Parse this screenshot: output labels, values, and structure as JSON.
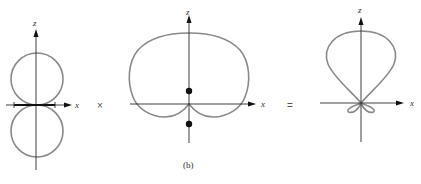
{
  "figure": {
    "caption": "(b)",
    "operators": {
      "times": "×",
      "equals": "="
    },
    "panels": [
      {
        "id": "element-pattern",
        "description": "Figure-eight dipole element pattern with two tangent circular lobes along z",
        "axis_labels": {
          "vertical": "z",
          "horizontal": "x"
        },
        "features": [
          "dipole element on x-axis"
        ]
      },
      {
        "id": "array-factor",
        "description": "Cardioid-like array factor with two point sources on z-axis",
        "axis_labels": {
          "vertical": "z",
          "horizontal": "x"
        },
        "features": [
          "source dot above x-axis",
          "source dot below x-axis"
        ]
      },
      {
        "id": "total-pattern",
        "description": "Resulting pattern: large upward main lobe with two small side lobes below",
        "axis_labels": {
          "vertical": "z",
          "horizontal": "x"
        },
        "features": [
          "main lobe",
          "two minor lobes"
        ]
      }
    ]
  },
  "colors": {
    "curve": "#8a8a8a",
    "axis": "#2a2a2a",
    "marker": "#111111"
  }
}
